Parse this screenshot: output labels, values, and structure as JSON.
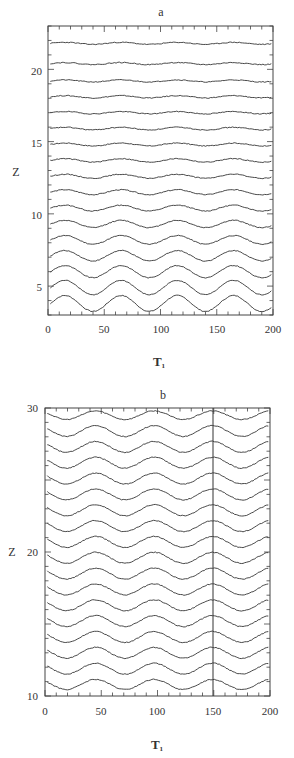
{
  "figure": {
    "panels": [
      {
        "id": "a",
        "title": "a",
        "xlabel": "T",
        "xlabel_sub": "1",
        "ylabel": "Z",
        "xticks": [
          "0",
          "50",
          "100",
          "150",
          "200"
        ],
        "yticks": [
          "5",
          "10",
          "15",
          "20"
        ]
      },
      {
        "id": "b",
        "title": "b",
        "xlabel": "T",
        "xlabel_sub": "1",
        "ylabel": "Z",
        "xticks": [
          "0",
          "50",
          "100",
          "150",
          "200"
        ],
        "yticks": [
          "10",
          "20",
          "30"
        ]
      }
    ]
  },
  "chart_data": [
    {
      "type": "line",
      "title": "a",
      "xlabel": "T1",
      "ylabel": "Z",
      "xlim": [
        0,
        200
      ],
      "ylim": [
        3,
        23
      ],
      "grid": false,
      "legend": "none",
      "description": "Stacked time series (waterfall) of 17 traces; wave-like oscillation with period ~50 in T1, amplitude decreasing with height Z",
      "x": [
        0,
        25,
        50,
        75,
        100,
        125,
        150,
        175,
        200
      ],
      "series": [
        {
          "name": "z=3.8",
          "offset": 3.8,
          "amplitude": 0.55,
          "period": 50,
          "phase_peak": 65
        },
        {
          "name": "z=4.9",
          "offset": 4.9,
          "amplitude": 0.5,
          "period": 50,
          "phase_peak": 65
        },
        {
          "name": "z=6.0",
          "offset": 6.0,
          "amplitude": 0.42,
          "period": 50,
          "phase_peak": 65
        },
        {
          "name": "z=7.1",
          "offset": 7.1,
          "amplitude": 0.36,
          "period": 50,
          "phase_peak": 65
        },
        {
          "name": "z=8.2",
          "offset": 8.2,
          "amplitude": 0.3,
          "period": 50,
          "phase_peak": 65
        },
        {
          "name": "z=9.3",
          "offset": 9.3,
          "amplitude": 0.25,
          "period": 50,
          "phase_peak": 65
        },
        {
          "name": "z=10.4",
          "offset": 10.4,
          "amplitude": 0.2,
          "period": 50,
          "phase_peak": 65
        },
        {
          "name": "z=11.5",
          "offset": 11.5,
          "amplitude": 0.17,
          "period": 50,
          "phase_peak": 65
        },
        {
          "name": "z=12.6",
          "offset": 12.6,
          "amplitude": 0.14,
          "period": 50,
          "phase_peak": 65
        },
        {
          "name": "z=13.7",
          "offset": 13.7,
          "amplitude": 0.12,
          "period": 50,
          "phase_peak": 65
        },
        {
          "name": "z=14.8",
          "offset": 14.8,
          "amplitude": 0.1,
          "period": 50,
          "phase_peak": 65
        },
        {
          "name": "z=15.9",
          "offset": 15.9,
          "amplitude": 0.09,
          "period": 50,
          "phase_peak": 65
        },
        {
          "name": "z=17.0",
          "offset": 17.0,
          "amplitude": 0.08,
          "period": 50,
          "phase_peak": 65
        },
        {
          "name": "z=18.1",
          "offset": 18.1,
          "amplitude": 0.08,
          "period": 50,
          "phase_peak": 65
        },
        {
          "name": "z=19.2",
          "offset": 19.2,
          "amplitude": 0.07,
          "period": 50,
          "phase_peak": 65
        },
        {
          "name": "z=20.4",
          "offset": 20.4,
          "amplitude": 0.07,
          "period": 50,
          "phase_peak": 65
        },
        {
          "name": "z=21.8",
          "offset": 21.8,
          "amplitude": 0.07,
          "period": 50,
          "phase_peak": 65
        }
      ]
    },
    {
      "type": "line",
      "title": "b",
      "xlabel": "T1",
      "ylabel": "Z",
      "xlim": [
        0,
        200
      ],
      "ylim": [
        10,
        30
      ],
      "grid": false,
      "legend": "none",
      "description": "Stacked time series (waterfall) of 18 traces; wave oscillation with period ~52 in T1, roughly uniform amplitude; vertical marker line at T1=150",
      "annotations": [
        {
          "type": "vline",
          "x": 150
        }
      ],
      "x": [
        0,
        25,
        50,
        75,
        100,
        125,
        150,
        175,
        200
      ],
      "series": [
        {
          "name": "z=10.8",
          "offset": 10.8,
          "amplitude": 0.35,
          "period": 52,
          "phase_peak": 45
        },
        {
          "name": "z=11.9",
          "offset": 11.9,
          "amplitude": 0.38,
          "period": 52,
          "phase_peak": 45
        },
        {
          "name": "z=13.0",
          "offset": 13.0,
          "amplitude": 0.38,
          "period": 52,
          "phase_peak": 45
        },
        {
          "name": "z=14.1",
          "offset": 14.1,
          "amplitude": 0.38,
          "period": 52,
          "phase_peak": 45
        },
        {
          "name": "z=15.2",
          "offset": 15.2,
          "amplitude": 0.38,
          "period": 52,
          "phase_peak": 45
        },
        {
          "name": "z=16.3",
          "offset": 16.3,
          "amplitude": 0.38,
          "period": 52,
          "phase_peak": 45
        },
        {
          "name": "z=17.4",
          "offset": 17.4,
          "amplitude": 0.38,
          "period": 52,
          "phase_peak": 45
        },
        {
          "name": "z=18.5",
          "offset": 18.5,
          "amplitude": 0.38,
          "period": 52,
          "phase_peak": 45
        },
        {
          "name": "z=19.6",
          "offset": 19.6,
          "amplitude": 0.38,
          "period": 52,
          "phase_peak": 45
        },
        {
          "name": "z=20.7",
          "offset": 20.7,
          "amplitude": 0.38,
          "period": 52,
          "phase_peak": 45
        },
        {
          "name": "z=21.8",
          "offset": 21.8,
          "amplitude": 0.38,
          "period": 52,
          "phase_peak": 45
        },
        {
          "name": "z=22.9",
          "offset": 22.9,
          "amplitude": 0.38,
          "period": 52,
          "phase_peak": 45
        },
        {
          "name": "z=24.0",
          "offset": 24.0,
          "amplitude": 0.38,
          "period": 52,
          "phase_peak": 45
        },
        {
          "name": "z=25.1",
          "offset": 25.1,
          "amplitude": 0.38,
          "period": 52,
          "phase_peak": 45
        },
        {
          "name": "z=26.2",
          "offset": 26.2,
          "amplitude": 0.38,
          "period": 52,
          "phase_peak": 45
        },
        {
          "name": "z=27.3",
          "offset": 27.3,
          "amplitude": 0.38,
          "period": 52,
          "phase_peak": 45
        },
        {
          "name": "z=28.4",
          "offset": 28.4,
          "amplitude": 0.38,
          "period": 52,
          "phase_peak": 45
        },
        {
          "name": "z=29.5",
          "offset": 29.5,
          "amplitude": 0.3,
          "period": 52,
          "phase_peak": 45
        }
      ]
    }
  ]
}
